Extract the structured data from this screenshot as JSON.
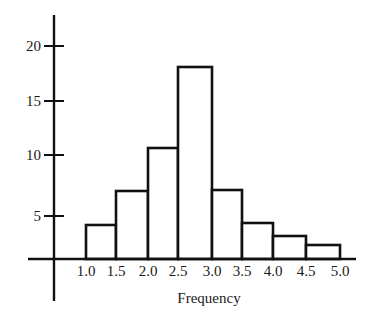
{
  "chart_data": {
    "type": "bar",
    "subtype": "histogram",
    "title": "",
    "xlabel": "Frequency",
    "ylabel": "",
    "x_tick_labels": [
      "1.0",
      "1.5",
      "2.0",
      "2.5",
      "3.0",
      "3.5",
      "4.0",
      "4.5",
      "5.0"
    ],
    "y_tick_labels": [
      "5",
      "10",
      "15",
      "20"
    ],
    "bins": [
      {
        "range": [
          1.0,
          1.5
        ],
        "value": 4
      },
      {
        "range": [
          1.5,
          2.0
        ],
        "value": 7
      },
      {
        "range": [
          2.0,
          2.5
        ],
        "value": 11
      },
      {
        "range": [
          2.5,
          3.0
        ],
        "value": 18
      },
      {
        "range": [
          3.0,
          3.5
        ],
        "value": 7
      },
      {
        "range": [
          3.5,
          4.0
        ],
        "value": 4
      },
      {
        "range": [
          4.0,
          4.5
        ],
        "value": 3
      },
      {
        "range": [
          4.5,
          5.0
        ],
        "value": 2
      }
    ],
    "categories": [
      "1.0-1.5",
      "1.5-2.0",
      "2.0-2.5",
      "2.5-3.0",
      "3.0-3.5",
      "3.5-4.0",
      "4.0-4.5",
      "4.5-5.0"
    ],
    "values": [
      4,
      7,
      11,
      18,
      7,
      4,
      3,
      2
    ],
    "xlim": [
      1.0,
      5.0
    ],
    "ylim": [
      0,
      22
    ],
    "grid": false,
    "legend": null
  },
  "render": {
    "y_ticks": [
      {
        "label": "20",
        "y": 46
      },
      {
        "label": "15",
        "y": 101
      },
      {
        "label": "10",
        "y": 155
      },
      {
        "label": "5",
        "y": 216
      }
    ],
    "baseline_y": 259,
    "bar_edges_x": [
      86,
      116,
      148,
      178,
      212,
      242,
      273,
      306,
      340
    ],
    "bar_tops_y": [
      225,
      191,
      148,
      67,
      190,
      223,
      236,
      245
    ],
    "x_label_y": 276,
    "xlabel_pos": {
      "x": 209,
      "y": 303
    }
  }
}
